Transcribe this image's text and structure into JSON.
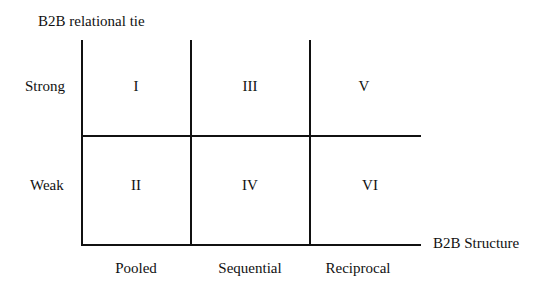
{
  "diagram": {
    "y_axis_title": "B2B relational tie",
    "x_axis_title": "B2B Structure",
    "rows": [
      {
        "label": "Strong"
      },
      {
        "label": "Weak"
      }
    ],
    "columns": [
      {
        "label": "Pooled"
      },
      {
        "label": "Sequential"
      },
      {
        "label": "Reciprocal"
      }
    ],
    "cells": {
      "strong_pooled": "I",
      "weak_pooled": "II",
      "strong_sequential": "III",
      "weak_sequential": "IV",
      "strong_reciprocal": "V",
      "weak_reciprocal": "VI"
    },
    "line_color": "#111111"
  }
}
